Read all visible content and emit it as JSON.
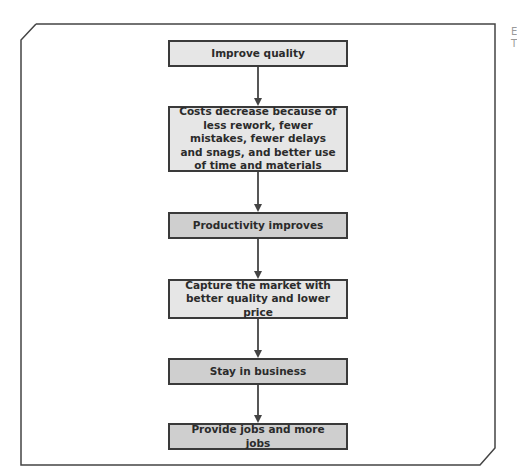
{
  "diagram": {
    "title": "",
    "steps": [
      {
        "id": "improve-quality",
        "label": "Improve quality",
        "shade": "light"
      },
      {
        "id": "costs-decrease",
        "label": "Costs decrease because of less rework, fewer mistakes, fewer delays and snags, and better use of time and materials",
        "shade": "light"
      },
      {
        "id": "productivity-improves",
        "label": "Productivity improves",
        "shade": "dark"
      },
      {
        "id": "capture-market",
        "label": "Capture the market with better quality and lower price",
        "shade": "light"
      },
      {
        "id": "stay-in-business",
        "label": "Stay in business",
        "shade": "dark"
      },
      {
        "id": "provide-jobs",
        "label": "Provide jobs and more jobs",
        "shade": "dark"
      }
    ],
    "edges": [
      {
        "from": "improve-quality",
        "to": "costs-decrease"
      },
      {
        "from": "costs-decrease",
        "to": "productivity-improves"
      },
      {
        "from": "productivity-improves",
        "to": "capture-market"
      },
      {
        "from": "capture-market",
        "to": "stay-in-business"
      },
      {
        "from": "stay-in-business",
        "to": "provide-jobs"
      }
    ],
    "side_text": [
      "E",
      "T"
    ],
    "colors": {
      "light_box": "#e6e6e6",
      "dark_box": "#cfcfcf",
      "border": "#3a3a3a"
    }
  }
}
